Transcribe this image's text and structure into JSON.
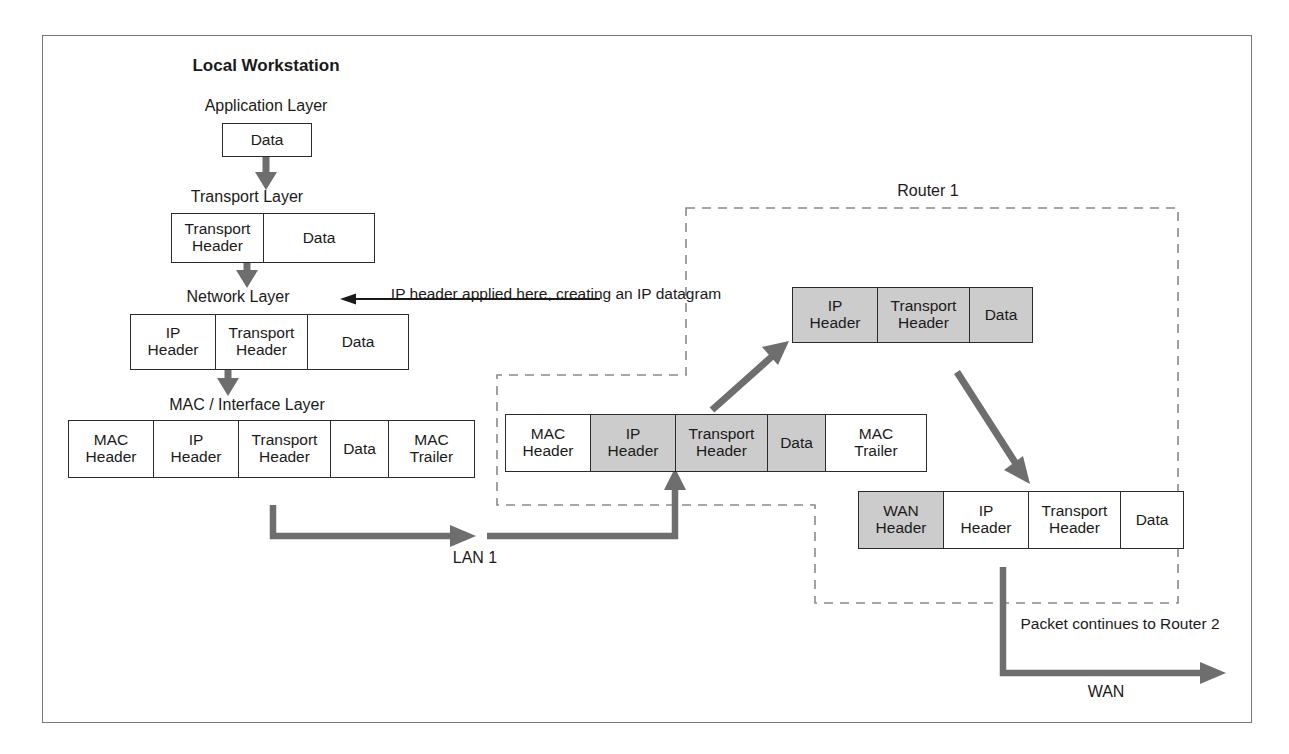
{
  "diagram": {
    "frame_color": "#777777",
    "accent_gray": "#cccccc",
    "arrow_color": "#6e6e6e",
    "line_color": "#2b2b2b"
  },
  "labels": {
    "local_workstation": "Local Workstation",
    "application_layer": "Application Layer",
    "transport_layer": "Transport Layer",
    "network_layer": "Network Layer",
    "mac_interface_layer": "MAC / Interface Layer",
    "router_1": "Router 1",
    "lan_1": "LAN 1",
    "wan": "WAN",
    "ip_note": "IP header\napplied here,\ncreating an IP\ndatagram",
    "packet_continues": "Packet continues\nto Router 2"
  },
  "packets": [
    {
      "id": "application-packet",
      "name": "application-layer-packet",
      "cells": [
        {
          "label": "Data",
          "fill": "white",
          "width": 88
        }
      ]
    },
    {
      "id": "transport-packet",
      "name": "transport-layer-packet",
      "cells": [
        {
          "label": "Transport\nHeader",
          "fill": "white",
          "width": 92
        },
        {
          "label": "Data",
          "fill": "white",
          "width": 110
        }
      ]
    },
    {
      "id": "network-packet",
      "name": "network-layer-packet",
      "cells": [
        {
          "label": "IP\nHeader",
          "fill": "white",
          "width": 85
        },
        {
          "label": "Transport\nHeader",
          "fill": "white",
          "width": 92
        },
        {
          "label": "Data",
          "fill": "white",
          "width": 100
        }
      ]
    },
    {
      "id": "mac-packet",
      "name": "mac-interface-layer-packet",
      "cells": [
        {
          "label": "MAC\nHeader",
          "fill": "white",
          "width": 85
        },
        {
          "label": "IP\nHeader",
          "fill": "white",
          "width": 85
        },
        {
          "label": "Transport\nHeader",
          "fill": "white",
          "width": 92
        },
        {
          "label": "Data",
          "fill": "white",
          "width": 58
        },
        {
          "label": "MAC\nTrailer",
          "fill": "white",
          "width": 85
        }
      ]
    },
    {
      "id": "lan-frame-packet",
      "name": "router-inbound-lan-frame",
      "cells": [
        {
          "label": "MAC\nHeader",
          "fill": "white",
          "width": 85
        },
        {
          "label": "IP\nHeader",
          "fill": "gray",
          "width": 85
        },
        {
          "label": "Transport\nHeader",
          "fill": "gray",
          "width": 92
        },
        {
          "label": "Data",
          "fill": "gray",
          "width": 58
        },
        {
          "label": "MAC\nTrailer",
          "fill": "white",
          "width": 100
        }
      ]
    },
    {
      "id": "ip-datagram-packet",
      "name": "router-ip-datagram",
      "cells": [
        {
          "label": "IP\nHeader",
          "fill": "gray",
          "width": 85
        },
        {
          "label": "Transport\nHeader",
          "fill": "gray",
          "width": 92
        },
        {
          "label": "Data",
          "fill": "gray",
          "width": 62
        }
      ]
    },
    {
      "id": "wan-packet",
      "name": "router-outbound-wan-frame",
      "cells": [
        {
          "label": "WAN\nHeader",
          "fill": "gray",
          "width": 85
        },
        {
          "label": "IP\nHeader",
          "fill": "white",
          "width": 85
        },
        {
          "label": "Transport\nHeader",
          "fill": "white",
          "width": 92
        },
        {
          "label": "Data",
          "fill": "white",
          "width": 62
        }
      ]
    }
  ]
}
